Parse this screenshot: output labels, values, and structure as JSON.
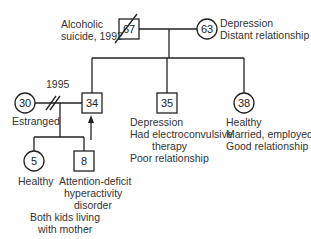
{
  "header_fragment": "— FAMILY GENOGRAM —",
  "grandparents": {
    "father": {
      "age": "67",
      "sex": "male",
      "deceased": true,
      "notes": [
        "Alcoholic",
        "suicide, 1992"
      ]
    },
    "mother": {
      "age": "63",
      "sex": "female",
      "notes": [
        "Depression",
        "Distant relationship"
      ]
    }
  },
  "children": [
    {
      "age": "34",
      "sex": "male",
      "identified_patient": true,
      "notes": []
    },
    {
      "age": "35",
      "sex": "male",
      "notes": [
        "Depression",
        "Had electroconvulsive",
        "therapy",
        "Poor relationship"
      ]
    },
    {
      "age": "38",
      "sex": "female",
      "notes": [
        "Healthy",
        "Married, employed",
        "Good relationship"
      ]
    }
  ],
  "ex_spouse": {
    "age": "30",
    "sex": "female",
    "notes": [
      "Estranged"
    ]
  },
  "divorce_year": "1995",
  "grandchildren": [
    {
      "age": "5",
      "sex": "female",
      "notes": [
        "Healthy"
      ]
    },
    {
      "age": "8",
      "sex": "male",
      "notes": [
        "Attention-deficit",
        "hyperactivity",
        "disorder"
      ]
    }
  ],
  "grandchildren_note": [
    "Both kids living",
    "with mother"
  ],
  "colors": {
    "line": "#222222",
    "text": "#333333"
  }
}
